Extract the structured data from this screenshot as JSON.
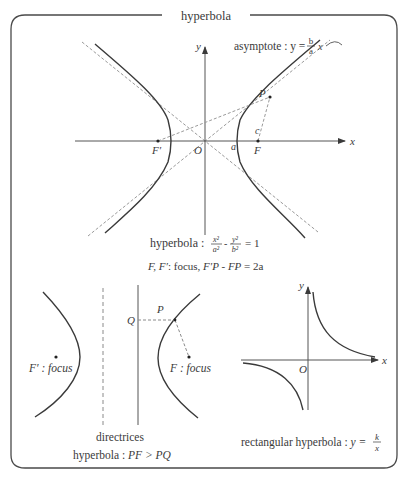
{
  "title": "hyperbola",
  "colors": {
    "frame": "#4a4a4a",
    "curve": "#3a3a3a",
    "axis": "#555555",
    "dashed": "#9a9a9a",
    "text": "#3a3a3a",
    "background": "#ffffff"
  },
  "main_diagram": {
    "asymptote_label": "asymptote : y = ",
    "asymptote_frac_num": "b",
    "asymptote_frac_den": "a",
    "asymptote_var": "x",
    "axis_x_label": "x",
    "axis_y_label": "y",
    "origin_label": "O",
    "vertex_label": "a",
    "focus_right_label": "F",
    "focus_left_label": "F′",
    "point_label": "P",
    "c_label": "c",
    "equation_prefix": "hyperbola : ",
    "eq_x_num": "x²",
    "eq_x_den": "a²",
    "eq_minus": "-",
    "eq_y_num": "y²",
    "eq_y_den": "b²",
    "eq_rhs": "= 1",
    "caption_foci": "F, F′",
    "caption_focus_word": ": focus, ",
    "caption_relation": "F′P - FP",
    "caption_rhs": " = 2a"
  },
  "directrix_diagram": {
    "left_focus_label": "F′ : focus",
    "right_focus_label": "F : focus",
    "q_label": "Q",
    "p_label": "P",
    "caption_line1": "directrices",
    "caption_prefix": "hyperbola : ",
    "caption_relation": "PF > PQ"
  },
  "rectangular_diagram": {
    "axis_x_label": "x",
    "axis_y_label": "y",
    "origin_label": "O",
    "caption_prefix": "rectangular hyperbola : ",
    "caption_y": "y = ",
    "frac_num": "k",
    "frac_den": "x"
  }
}
